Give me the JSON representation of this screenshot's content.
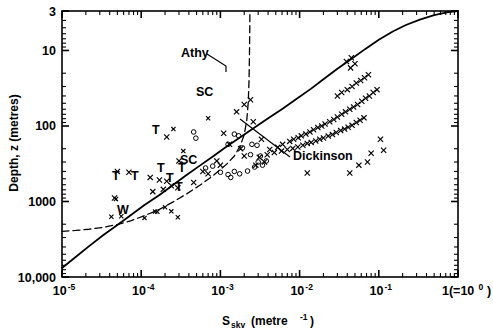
{
  "figure": {
    "title": "",
    "background": "#ffffff",
    "ink_color": "#000000"
  },
  "axes": {
    "x": {
      "label_main": "S",
      "label_sub": "skv",
      "label_unit": "(metre",
      "label_unit_sup": "-1",
      "label_unit_close": ")",
      "label_full": "S skv (metre -1)",
      "scale": "log",
      "min": 1e-05,
      "max": 1.0,
      "tick_labels": [
        "10",
        "10",
        "10",
        "10",
        "10",
        "1(=10"
      ],
      "tick_exponents": [
        "-5",
        "-4",
        "-3",
        "-2",
        "-1",
        "0"
      ],
      "tick_values": [
        1e-05,
        0.0001,
        0.001,
        0.01,
        0.1,
        1.0
      ],
      "last_tick_suffix": ")",
      "minor_ticks": true
    },
    "y": {
      "label": "Depth, z (metres)",
      "scale": "log",
      "min_top": 3,
      "max_bottom": 10000,
      "inverted": true,
      "tick_labels": [
        "3",
        "10",
        "100",
        "1000",
        "10,000"
      ],
      "tick_values": [
        3,
        10,
        100,
        1000,
        10000
      ],
      "minor_ticks": true
    }
  },
  "annotations": [
    {
      "name": "athy-label",
      "text": "Athy",
      "x": 181,
      "y": 57,
      "leader": true
    },
    {
      "name": "dickinson-label",
      "text": "Dickinson",
      "x": 293,
      "y": 160,
      "leader": true
    },
    {
      "name": "sc-label-upper",
      "text": "SC",
      "x": 196,
      "y": 96,
      "leader": false
    },
    {
      "name": "sc-label-lower",
      "text": "SC",
      "x": 180,
      "y": 164,
      "leader": false
    }
  ],
  "point_labels": [
    {
      "name": "label-T-1",
      "text": "T",
      "x": 152,
      "y": 134
    },
    {
      "name": "label-T-2",
      "text": "T",
      "x": 112,
      "y": 180
    },
    {
      "name": "label-T-3",
      "text": "T",
      "x": 131,
      "y": 180
    },
    {
      "name": "label-T-4",
      "text": "T",
      "x": 166,
      "y": 182
    },
    {
      "name": "label-T-5",
      "text": "T",
      "x": 175,
      "y": 191
    },
    {
      "name": "label-T-6",
      "text": "T",
      "x": 157,
      "y": 172
    },
    {
      "name": "label-T-7",
      "text": "T",
      "x": 178,
      "y": 172
    },
    {
      "name": "label-W-1",
      "text": "W",
      "x": 117,
      "y": 214
    }
  ],
  "chart_data": {
    "type": "scatter",
    "title": "",
    "xlabel": "S skv (metre -1)",
    "ylabel": "Depth, z (metres)",
    "xscale": "log",
    "yscale": "log",
    "y_inverted": true,
    "xlim": [
      1e-05,
      1.0
    ],
    "ylim": [
      3,
      10000
    ],
    "grid": false,
    "legend": "none",
    "series": [
      {
        "name": "Dickinson",
        "type": "line",
        "style": "solid",
        "points_xy": [
          [
            1e-05,
            7600
          ],
          [
            1.5e-05,
            5400
          ],
          [
            2.2e-05,
            3900
          ],
          [
            3.3e-05,
            2800
          ],
          [
            5e-05,
            2050
          ],
          [
            7.5e-05,
            1500
          ],
          [
            0.00011,
            1110
          ],
          [
            0.00017,
            820
          ],
          [
            0.00025,
            610
          ],
          [
            0.00037,
            450
          ],
          [
            0.00055,
            335
          ],
          [
            0.00082,
            250
          ],
          [
            0.0012,
            187
          ],
          [
            0.0018,
            140
          ],
          [
            0.0027,
            105
          ],
          [
            0.0041,
            78
          ],
          [
            0.0061,
            59
          ],
          [
            0.0091,
            44
          ],
          [
            0.014,
            32
          ],
          [
            0.02,
            24
          ],
          [
            0.03,
            17.5
          ],
          [
            0.045,
            13.0
          ],
          [
            0.067,
            9.6
          ],
          [
            0.1,
            7.2
          ],
          [
            0.15,
            5.6
          ],
          [
            0.22,
            4.6
          ],
          [
            0.33,
            3.9
          ],
          [
            0.5,
            3.4
          ],
          [
            0.75,
            3.1
          ],
          [
            1.0,
            3.0
          ]
        ]
      },
      {
        "name": "Athy",
        "type": "line",
        "style": "dashed",
        "points_xy": [
          [
            1e-05,
            2480
          ],
          [
            1.5e-05,
            2420
          ],
          [
            2.2e-05,
            2330
          ],
          [
            3.3e-05,
            2200
          ],
          [
            5e-05,
            2020
          ],
          [
            7.5e-05,
            1790
          ],
          [
            0.00011,
            1540
          ],
          [
            0.00017,
            1270
          ],
          [
            0.00025,
            1020
          ],
          [
            0.00037,
            800
          ],
          [
            0.00055,
            610
          ],
          [
            0.00082,
            450
          ],
          [
            0.0012,
            320
          ],
          [
            0.0015,
            250
          ],
          [
            0.0018,
            178
          ],
          [
            0.002,
            130
          ],
          [
            0.00215,
            85
          ],
          [
            0.00225,
            48
          ],
          [
            0.0023,
            24
          ],
          [
            0.00233,
            11
          ],
          [
            0.00235,
            5
          ],
          [
            0.00236,
            3
          ]
        ]
      }
    ],
    "scatter_cross": {
      "name": "data-crosses",
      "marker": "x",
      "count": 96,
      "points_xy": [
        [
          0.0033,
          150
        ],
        [
          0.002,
          250
        ],
        [
          0.0011,
          125
        ],
        [
          0.0013,
          175
        ],
        [
          0.0018,
          200
        ],
        [
          5e-05,
          400
        ],
        [
          7e-05,
          410
        ],
        [
          0.00013,
          480
        ],
        [
          0.00017,
          520
        ],
        [
          0.00021,
          540
        ],
        [
          0.00024,
          620
        ],
        [
          0.00029,
          660
        ],
        [
          0.00019,
          690
        ],
        [
          0.00021,
          140
        ],
        [
          0.0003,
          290
        ],
        [
          0.00046,
          560
        ],
        [
          4.6e-05,
          900
        ],
        [
          0.00014,
          740
        ],
        [
          0.0028,
          330
        ],
        [
          0.0036,
          300
        ],
        [
          0.0042,
          205
        ],
        [
          0.0053,
          192
        ],
        [
          0.0061,
          175
        ],
        [
          0.0075,
          160
        ],
        [
          0.0084,
          150
        ],
        [
          0.0096,
          143
        ],
        [
          0.0105,
          135
        ],
        [
          0.012,
          128
        ],
        [
          0.0135,
          120
        ],
        [
          0.015,
          112
        ],
        [
          0.017,
          105
        ],
        [
          0.019,
          100
        ],
        [
          0.021,
          94
        ],
        [
          0.024,
          88
        ],
        [
          0.027,
          82
        ],
        [
          0.03,
          76
        ],
        [
          0.034,
          70
        ],
        [
          0.038,
          65
        ],
        [
          0.043,
          60
        ],
        [
          0.048,
          56
        ],
        [
          0.054,
          52
        ],
        [
          0.061,
          47
        ],
        [
          0.068,
          43
        ],
        [
          0.076,
          40
        ],
        [
          0.085,
          36
        ],
        [
          0.095,
          33
        ],
        [
          0.0031,
          260
        ],
        [
          0.0039,
          240
        ],
        [
          0.0048,
          225
        ],
        [
          0.0059,
          215
        ],
        [
          0.007,
          205
        ],
        [
          0.0082,
          198
        ],
        [
          0.0095,
          190
        ],
        [
          0.011,
          180
        ],
        [
          0.0125,
          170
        ],
        [
          0.014,
          165
        ],
        [
          0.016,
          158
        ],
        [
          0.018,
          150
        ],
        [
          0.02,
          144
        ],
        [
          0.023,
          136
        ],
        [
          0.026,
          130
        ],
        [
          0.029,
          122
        ],
        [
          0.033,
          115
        ],
        [
          0.037,
          110
        ],
        [
          0.041,
          104
        ],
        [
          0.046,
          98
        ],
        [
          0.052,
          90
        ],
        [
          0.058,
          84
        ],
        [
          0.065,
          78
        ],
        [
          0.03,
          40
        ],
        [
          0.034,
          36
        ],
        [
          0.04,
          33
        ],
        [
          0.046,
          30
        ],
        [
          0.052,
          27
        ],
        [
          0.059,
          25
        ],
        [
          0.066,
          23
        ],
        [
          0.074,
          21
        ],
        [
          0.044,
          17
        ],
        [
          0.05,
          15
        ],
        [
          0.039,
          14
        ],
        [
          0.045,
          12.5
        ],
        [
          0.105,
          150
        ],
        [
          0.115,
          210
        ],
        [
          0.08,
          230
        ],
        [
          0.072,
          300
        ],
        [
          0.056,
          330
        ],
        [
          0.043,
          420
        ],
        [
          0.0125,
          420
        ],
        [
          0.0026,
          88
        ],
        [
          0.0009,
          290
        ],
        [
          0.001,
          330
        ],
        [
          0.0006,
          400
        ],
        [
          0.0007,
          430
        ],
        [
          0.0016,
          65
        ],
        [
          0.002,
          52
        ],
        [
          0.0024,
          45
        ]
      ]
    },
    "scatter_circle": {
      "name": "data-open-circles",
      "marker": "o",
      "count": 22,
      "points_xy": [
        [
          0.00046,
          120
        ],
        [
          0.00049,
          145
        ],
        [
          0.0015,
          128
        ],
        [
          0.0017,
          135
        ],
        [
          0.00125,
          175
        ],
        [
          0.0019,
          195
        ],
        [
          0.0025,
          175
        ],
        [
          0.0029,
          180
        ],
        [
          0.001,
          410
        ],
        [
          0.00125,
          440
        ],
        [
          0.0015,
          400
        ],
        [
          0.00175,
          430
        ],
        [
          0.0022,
          395
        ],
        [
          0.00135,
          480
        ],
        [
          0.003,
          300
        ],
        [
          0.0034,
          330
        ],
        [
          0.0027,
          350
        ],
        [
          0.0038,
          290
        ],
        [
          0.0032,
          250
        ],
        [
          0.0024,
          240
        ],
        [
          0.00065,
          360
        ],
        [
          0.0008,
          340
        ]
      ]
    },
    "marker_crosses_near_labels": [
      [
        4.8e-05,
        930
      ],
      [
        0.00015,
        1360
      ],
      [
        0.0002,
        1190
      ],
      [
        4.2e-05,
        1590
      ],
      [
        5.6e-05,
        1570
      ],
      [
        0.00011,
        1650
      ],
      [
        0.00016,
        1370
      ],
      [
        0.00024,
        1350
      ],
      [
        0.00029,
        1620
      ],
      [
        0.000255,
        110
      ],
      [
        0.00034,
        215
      ],
      [
        0.0007,
        79
      ]
    ]
  }
}
